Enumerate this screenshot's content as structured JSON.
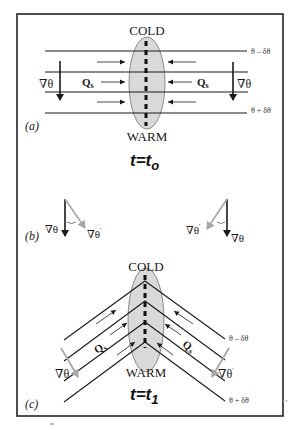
{
  "colors": {
    "ink": "#1a1a1a",
    "ellipse_fill": "#d9d9d9",
    "ellipse_stroke": "#707070",
    "gray_arrow": "#a6a6a6",
    "frame": "#222222"
  },
  "panel_a": {
    "label": "(a)",
    "top_label": "COLD",
    "bottom_label": "WARM",
    "iso_upper": "θ – δθ",
    "iso_lower": "θ + δθ",
    "grad_left": "∇θ",
    "grad_right": "∇θ",
    "q_left": "Q",
    "q_left_sub": "s",
    "q_right": "Q",
    "q_right_sub": "s",
    "time_t": "t",
    "time_eq": "=",
    "time_tv": "t",
    "time_sub": "o"
  },
  "panel_b": {
    "label": "(b)",
    "left_grad": "∇θ",
    "left_grad_prime": "∇θ",
    "right_grad_prime": "∇θ",
    "right_grad": "∇θ",
    "prime": "'"
  },
  "panel_c": {
    "label": "(c)",
    "top_label": "COLD",
    "bottom_label": "WARM",
    "iso_upper": "θ – δθ",
    "iso_lower": "θ + δθ",
    "grad_left": "∇θ",
    "grad_right": "∇θ",
    "q_left": "Q",
    "q_left_sub": "s",
    "q_right": "Q",
    "q_right_sub": "s",
    "time_t": "t",
    "time_eq": "=",
    "time_tv": "t",
    "time_sub": "1"
  }
}
